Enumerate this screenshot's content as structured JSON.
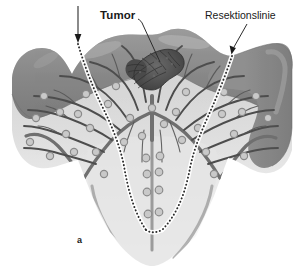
{
  "figure": {
    "panel_label": "a",
    "caption_labels": {
      "tumor": "Tumor",
      "resection_line": "Resektionslinie"
    },
    "colors": {
      "background": "#ffffff",
      "mucosa_dark": "#8a8a8a",
      "mucosa_dark_shade": "#7a7a7a",
      "mucosa_highlight": "#a3a3a3",
      "submucosa_light": "#cdcdcd",
      "submucosa_lighter": "#dcdcdc",
      "deep_fade": "#f2f2f2",
      "vessel": "#6f6f6f",
      "vessel_thin": "#4a4a4a",
      "node_fill": "#c4c4c4",
      "node_stroke": "#8d8d8d",
      "tumor_dark": "#555555",
      "tumor_texture": "#3a3a3a",
      "dotted_line": "#2b2b2b",
      "leader_line": "#2b2b2b",
      "label_text": "#1a1a1a"
    },
    "elements": {
      "tumor_description": "irregular dark textured mass on mucosal surface",
      "resection_line_description": "white-bordered dotted line descending on both sides into a U shape",
      "arrow_left": "vertical down arrow to left resection line",
      "arrow_right": "diagonal leader arrow to right resection line",
      "lymph_nodes_count": 38,
      "vessel_tree": "branching lymphatic/vascular tree converging to central trunk"
    }
  }
}
